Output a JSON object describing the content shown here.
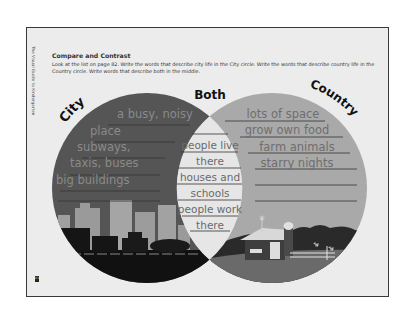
{
  "page": {
    "side_caption": "The Visual Guide to Kindergarten",
    "page_number": "83",
    "title": "Compare and Contrast",
    "instructions": "Look at the list on page 82. Write the words that describe city life in the City circle. Write the words that describe country life in the Country circle. Write words that describe both in the middle."
  },
  "venn": {
    "labels": {
      "left": "City",
      "middle": "Both",
      "right": "Country"
    },
    "colors": {
      "city_circle": "#555555",
      "country_circle": "#a9a9a9",
      "overlap": "#e6e6e6",
      "city_text": "#8a8a8a",
      "both_text": "#6a6a6a",
      "country_text": "#6e6e6e",
      "lines": "#333333"
    },
    "city_entries": [
      "a busy, noisy",
      "place",
      "subways,",
      "taxis, buses",
      "big buildings",
      ""
    ],
    "both_entries": [
      "people live",
      "there",
      "houses and",
      "schools",
      "people work",
      "there"
    ],
    "country_entries": [
      "lots of space",
      "grow own food",
      "farm animals",
      "starry nights",
      "",
      ""
    ],
    "illustrations": {
      "city": "city-skyline-with-vehicles",
      "country": "farm-with-barn-silo-and-fence"
    }
  }
}
